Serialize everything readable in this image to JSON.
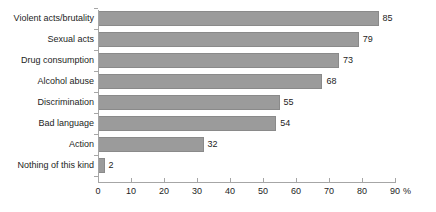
{
  "chart_data": {
    "type": "bar",
    "orientation": "horizontal",
    "title": "",
    "subtitle": "",
    "xlabel": "%",
    "ylabel": "",
    "categories": [
      "Violent acts/brutality",
      "Sexual acts",
      "Drug consumption",
      "Alcohol abuse",
      "Discrimination",
      "Bad language",
      "Action",
      "Nothing of this kind"
    ],
    "values": [
      85,
      79,
      73,
      68,
      55,
      54,
      32,
      2
    ],
    "value_labels": [
      "85",
      "79",
      "73",
      "68",
      "55",
      "54",
      "32",
      "2"
    ],
    "xlim": [
      0,
      90
    ],
    "xticks": [
      0,
      10,
      20,
      30,
      40,
      50,
      60,
      70,
      80,
      90
    ],
    "xtick_labels": [
      "0",
      "10",
      "20",
      "30",
      "40",
      "50",
      "60",
      "70",
      "80",
      "90"
    ],
    "x_unit_label": "%",
    "grid": false,
    "legend": false,
    "legend_position": "none",
    "bar_color": "#9b9b9b",
    "bar_edge_color": "#8a8a8a",
    "axis_color": "#a6a6a6",
    "text_color": "#1d1d1d",
    "background_color": "#ffffff"
  }
}
